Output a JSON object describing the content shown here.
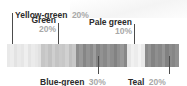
{
  "figure": {
    "width": 187,
    "height": 86
  },
  "chart_data": {
    "type": "bar",
    "title": "",
    "xlabel": "",
    "ylabel": "",
    "orientation": "horizontal-stacked",
    "grid": false,
    "legend_position": "callouts",
    "categories": [
      "Yellow-green",
      "Green",
      "Blue-green",
      "Pale green",
      "Teal"
    ],
    "values": [
      20,
      30,
      30,
      10,
      20
    ],
    "value_labels": [
      "20%",
      "20%",
      "30%",
      "10%",
      "20%"
    ],
    "unit": "%",
    "note": "Rendered in grayscale; each category spans several narrow vertical stripes of slightly varied tone.",
    "segments": [
      {
        "label": "Yellow-green",
        "value_label": "20%",
        "value": 20,
        "swatch_hex": "#e8e8e8",
        "stripes": [
          "#e9e9e9",
          "#ededed",
          "#e3e3e3",
          "#eaeaea",
          "#e6e6e6",
          "#efefef",
          "#e4e4e4",
          "#ebebeb",
          "#e7e7e7",
          "#e1e1e1"
        ]
      },
      {
        "label": "Green",
        "value_label": "20%",
        "value": 20,
        "swatch_hex": "#c9c9c9",
        "stripes": [
          "#c6c6c6",
          "#cccccc",
          "#c2c2c2",
          "#cfcfcf",
          "#c4c4c4",
          "#cacaca",
          "#c7c7c7",
          "#d1d1d1",
          "#c0c0c0",
          "#c8c8c8"
        ]
      },
      {
        "label": "Blue-green",
        "value_label": "30%",
        "value": 30,
        "swatch_hex": "#8f8f8f",
        "stripes": [
          "#8d8d8d",
          "#9a9a9a",
          "#868686",
          "#949494",
          "#8b8b8b",
          "#9d9d9d",
          "#848484",
          "#929292",
          "#898989",
          "#979797",
          "#8e8e8e",
          "#828282",
          "#909090",
          "#999999",
          "#878787"
        ]
      },
      {
        "label": "Pale green",
        "value_label": "10%",
        "value": 10,
        "swatch_hex": "#ededed",
        "stripes": [
          "#e6e6e6",
          "#f1f1f1",
          "#ececec",
          "#f4f4f4",
          "#e9e9e9"
        ]
      },
      {
        "label": "Teal",
        "value_label": "20%",
        "value": 20,
        "swatch_hex": "#8a8a8a",
        "stripes": [
          "#8a8a8a",
          "#949494",
          "#838383",
          "#8f8f8f",
          "#888888",
          "#969696",
          "#818181",
          "#8c8c8c",
          "#868686",
          "#919191"
        ]
      }
    ]
  },
  "callouts": [
    {
      "id": "yellow-green",
      "name": "Yellow-green",
      "pct": "20%"
    },
    {
      "id": "green",
      "name": "Green",
      "pct": "20%"
    },
    {
      "id": "pale-green",
      "name": "Pale green",
      "pct": "10%"
    },
    {
      "id": "blue-green",
      "name": "Blue-green",
      "pct": "30%"
    },
    {
      "id": "teal",
      "name": "Teal",
      "pct": "20%"
    }
  ],
  "colors": {
    "text": "#2b2b2b",
    "percent_text": "#a8a8a8",
    "leader_line": "#4c4c4c",
    "background": "#ffffff"
  }
}
